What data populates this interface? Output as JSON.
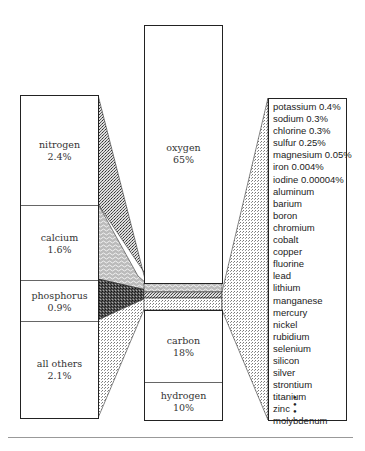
{
  "chart_data": {
    "type": "diagram",
    "title": "",
    "main_column": [
      {
        "element": "oxygen",
        "percent": 65,
        "label": "65%"
      },
      {
        "element": "carbon",
        "percent": 18,
        "label": "18%"
      },
      {
        "element": "hydrogen",
        "percent": 10,
        "label": "10%"
      }
    ],
    "left_column": [
      {
        "element": "nitrogen",
        "percent": 2.4,
        "label": "2.4%"
      },
      {
        "element": "calcium",
        "percent": 1.6,
        "label": "1.6%"
      },
      {
        "element": "phosphorus",
        "percent": 0.9,
        "label": "0.9%"
      },
      {
        "element": "all others",
        "percent": 2.1,
        "label": "2.1%"
      }
    ],
    "right_column": [
      "potassium 0.4%",
      "sodium 0.3%",
      "chlorine 0.3%",
      "sulfur 0.25%",
      "magnesium 0.05%",
      "iron 0.004%",
      "iodine 0.00004%",
      "aluminum",
      "barium",
      "boron",
      "chromium",
      "cobalt",
      "copper",
      "fluorine",
      "lead",
      "lithium",
      "manganese",
      "mercury",
      "nickel",
      "rubidium",
      "selenium",
      "silicon",
      "silver",
      "strontium",
      "titanium",
      "zinc",
      "molybdenum"
    ],
    "continuation": "⋮"
  },
  "left": {
    "nitrogen": {
      "name": "nitrogen",
      "value": "2.4%"
    },
    "calcium": {
      "name": "calcium",
      "value": "1.6%"
    },
    "phosphorus": {
      "name": "phosphorus",
      "value": "0.9%"
    },
    "others": {
      "name": "all others",
      "value": "2.1%"
    }
  },
  "middle": {
    "oxygen": {
      "name": "oxygen",
      "value": "65%"
    },
    "carbon": {
      "name": "carbon",
      "value": "18%"
    },
    "hydrogen": {
      "name": "hydrogen",
      "value": "10%"
    }
  },
  "right": {
    "items": [
      "potassium 0.4%",
      "sodium 0.3%",
      "chlorine 0.3%",
      "sulfur 0.25%",
      "magnesium 0.05%",
      "iron 0.004%",
      "iodine 0.00004%",
      "aluminum",
      "barium",
      "boron",
      "chromium",
      "cobalt",
      "copper",
      "fluorine",
      "lead",
      "lithium",
      "manganese",
      "mercury",
      "nickel",
      "rubidium",
      "selenium",
      "silicon",
      "silver",
      "strontium",
      "titanium",
      "zinc",
      "molybdenum"
    ]
  }
}
